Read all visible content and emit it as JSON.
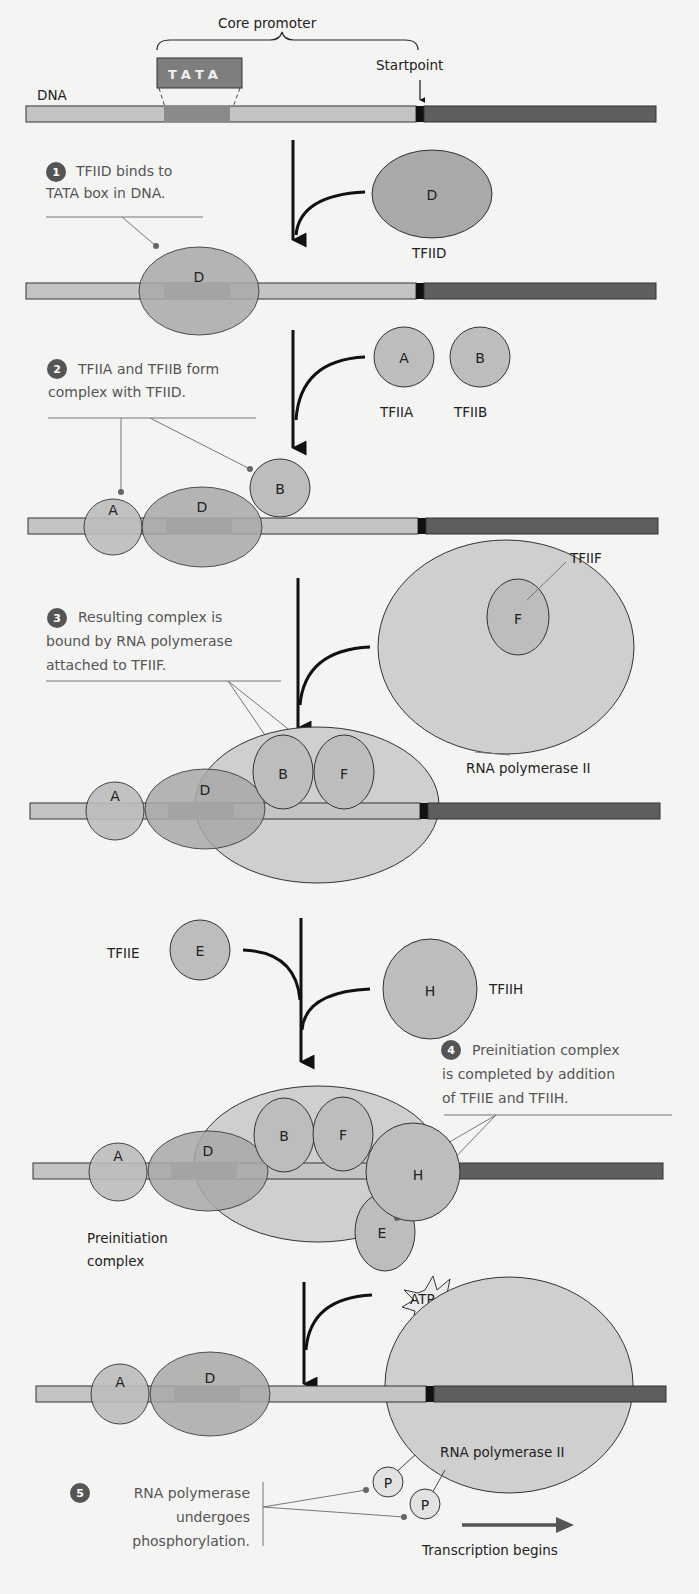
{
  "figure": {
    "labels": {
      "core_promoter": "Core promoter",
      "tata_box": "TATA",
      "startpoint": "Startpoint",
      "dna": "DNA",
      "tfiid": "TFIID",
      "tfiia": "TFIIA",
      "tfiib": "TFIIB",
      "tfiif": "TFIIF",
      "rna_pol_ii": "RNA polymerase II",
      "tfiie": "TFIIE",
      "tfiih": "TFIIH",
      "preinitiation_line1": "Preinitiation",
      "preinitiation_line2": "complex",
      "atp": "ATP",
      "transcription_begins": "Transcription begins"
    },
    "protein_glyphs": {
      "A": "A",
      "B": "B",
      "D": "D",
      "E": "E",
      "F": "F",
      "H": "H",
      "P": "P"
    },
    "steps": [
      {
        "number": "1",
        "lines": [
          "TFIID binds to",
          "TATA box in DNA."
        ]
      },
      {
        "number": "2",
        "lines": [
          "TFIIA and TFIIB form",
          "complex with TFIID."
        ]
      },
      {
        "number": "3",
        "lines": [
          "Resulting complex is",
          "bound by RNA polymerase",
          "attached to TFIIF."
        ]
      },
      {
        "number": "4",
        "lines": [
          "Preinitiation complex",
          "is completed by addition",
          "of TFIIE and TFIIH."
        ]
      },
      {
        "number": "5",
        "lines": [
          "RNA polymerase",
          "undergoes",
          "phosphorylation."
        ]
      }
    ],
    "colors": {
      "dna_light": "#c4c4c4",
      "dna_tata": "#8a8a8a",
      "dna_coding": "#5e5e5e",
      "startpoint_mark": "#111111",
      "protein_fill": "#bdbdbd",
      "polymerase_fill": "#cfcfcf",
      "step_badge": "#555555"
    }
  }
}
